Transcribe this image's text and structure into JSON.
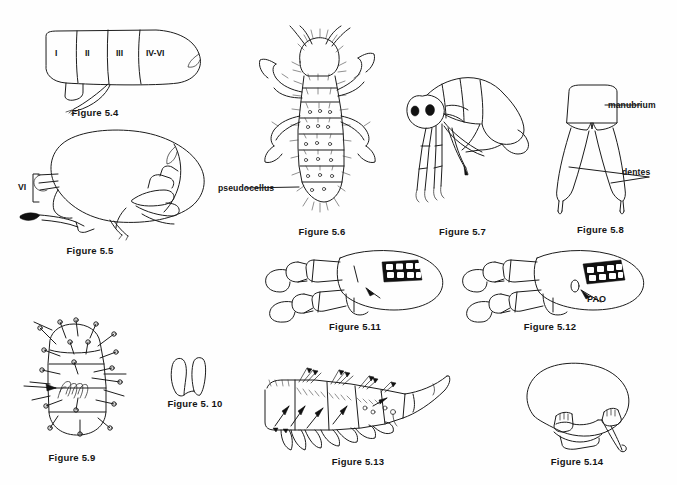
{
  "plate": {
    "title": "Collembola morphology figure plate",
    "background_color": "#fefefe",
    "ink_color": "#1c1c1c",
    "width": 677,
    "height": 485
  },
  "figures": [
    {
      "id": "fig-5-4",
      "caption": "Figure 5.4",
      "description": "abdomen with numbered segments, lateral view",
      "segment_labels": [
        "I",
        "II",
        "III",
        "IV-VI"
      ]
    },
    {
      "id": "fig-5-5",
      "caption": "Figure 5.5",
      "description": "globular springtail body, lateral view",
      "labels": [
        "VI"
      ]
    },
    {
      "id": "fig-5-6",
      "caption": "Figure 5.6",
      "description": "dorsal view of hairy springtail",
      "labels": [
        "pseudocellus"
      ]
    },
    {
      "id": "fig-5-7",
      "caption": "Figure 5.7",
      "description": "lateral view of springtail with eye patches and legs"
    },
    {
      "id": "fig-5-8",
      "caption": "Figure 5.8",
      "description": "furcula showing manubrium and dentes",
      "labels": [
        "manubrium",
        "dentes"
      ]
    },
    {
      "id": "fig-5-9",
      "caption": "Figure 5.9",
      "description": "setose body segments with arrow pointing to structure"
    },
    {
      "id": "fig-5-10",
      "caption": "Figure 5. 10",
      "description": "pair of small lobed structures"
    },
    {
      "id": "fig-5-11",
      "caption": "Figure 5.11",
      "description": "head with antenna and ocelli patch, arrow indicator"
    },
    {
      "id": "fig-5-12",
      "caption": "Figure 5.12",
      "description": "head with antenna, ocelli patch and post-antennal organ",
      "labels": [
        "PAO"
      ]
    },
    {
      "id": "fig-5-13",
      "caption": "Figure 5.13",
      "description": "lateral abdomen with spines, arrows indicating setae"
    },
    {
      "id": "fig-5-14",
      "caption": "Figure 5.14",
      "description": "globular body outline with legs"
    }
  ],
  "labels": {
    "seg_1": "I",
    "seg_2": "II",
    "seg_3": "III",
    "seg_4_6": "IV-VI",
    "seg_vi": "VI",
    "pseudocellus": "pseudocellus",
    "manubrium": "manubrium",
    "dentes": "dentes",
    "pao": "PAO"
  },
  "captions": {
    "f54": "Figure 5.4",
    "f55": "Figure 5.5",
    "f56": "Figure 5.6",
    "f57": "Figure 5.7",
    "f58": "Figure 5.8",
    "f59": "Figure 5.9",
    "f510": "Figure 5. 10",
    "f511": "Figure 5.11",
    "f512": "Figure 5.12",
    "f513": "Figure 5.13",
    "f514": "Figure 5.14"
  }
}
